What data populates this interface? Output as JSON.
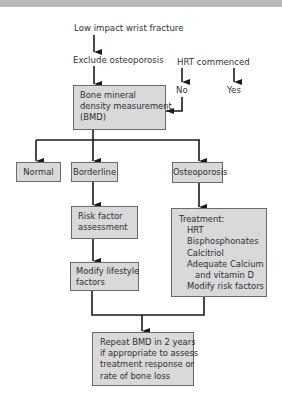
{
  "diagram": {
    "type": "flowchart",
    "start": "Low impact wrist fracture",
    "step2": "Exclude osteoporosis",
    "hrt": {
      "question": "HRT commenced",
      "no": "No",
      "yes": "Yes"
    },
    "bmd": [
      "Bone mineral",
      "density measurement",
      "(BMD)"
    ],
    "outcomes": {
      "normal": "Normal",
      "borderline": "Borderline",
      "osteoporosis": "Osteoporosis"
    },
    "risk_assessment": [
      "Risk factor",
      "assessment"
    ],
    "modify_lifestyle": [
      "Modify lifestyle",
      "factors"
    ],
    "treatment": [
      "Treatment:",
      "HRT",
      "Bisphosphonates",
      "Calcitriol",
      "Adequate Calcium",
      "and vitamin D",
      "Modify risk factors"
    ],
    "repeat": [
      "Repeat BMD in 2 years",
      "if appropriate to assess",
      "treatment response or",
      "rate of bone loss"
    ],
    "colors": {
      "box_fill": "#d9d9d9",
      "box_border": "#6a6a6a",
      "line": "#1a1a1a",
      "band": "#b9b9b9"
    }
  }
}
